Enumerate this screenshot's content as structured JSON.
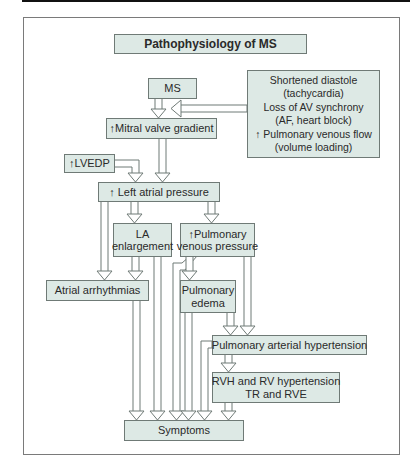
{
  "diagram": {
    "title": "Pathophysiology of MS",
    "nodes": {
      "ms": "MS",
      "precipitants": [
        "Shortened diastole",
        "(tachycardia)",
        "Loss of AV synchrony",
        "(AF, heart block)",
        "↑ Pulmonary venous flow",
        "(volume loading)"
      ],
      "mitral_gradient": "↑Mitral valve gradient",
      "lvedp": "↑LVEDP",
      "left_atrial_pressure": "↑ Left atrial pressure",
      "la_enlargement": [
        "LA",
        "enlargement"
      ],
      "pulm_venous_pressure": [
        "↑Pulmonary",
        "venous pressure"
      ],
      "atrial_arrhythmias": "Atrial arrhythmias",
      "pulmonary_edema": [
        "Pulmonary",
        "edema"
      ],
      "pah": "Pulmonary arterial hypertension",
      "rvh": [
        "RVH and RV hypertension",
        "TR and RVE"
      ],
      "symptoms": "Symptoms"
    },
    "edges": [
      {
        "from": "ms",
        "to": "mitral_gradient"
      },
      {
        "from": "precipitants",
        "to": "mitral_gradient"
      },
      {
        "from": "mitral_gradient",
        "to": "left_atrial_pressure"
      },
      {
        "from": "lvedp",
        "to": "left_atrial_pressure"
      },
      {
        "from": "left_atrial_pressure",
        "to": "la_enlargement"
      },
      {
        "from": "left_atrial_pressure",
        "to": "pulm_venous_pressure"
      },
      {
        "from": "left_atrial_pressure",
        "to": "atrial_arrhythmias"
      },
      {
        "from": "la_enlargement",
        "to": "atrial_arrhythmias"
      },
      {
        "from": "la_enlargement",
        "to": "symptoms"
      },
      {
        "from": "pulm_venous_pressure",
        "to": "pulmonary_edema"
      },
      {
        "from": "pulm_venous_pressure",
        "to": "symptoms"
      },
      {
        "from": "pulm_venous_pressure",
        "to": "pah"
      },
      {
        "from": "pulmonary_edema",
        "to": "symptoms"
      },
      {
        "from": "pulmonary_edema",
        "to": "pah"
      },
      {
        "from": "atrial_arrhythmias",
        "to": "symptoms"
      },
      {
        "from": "pah",
        "to": "rvh"
      },
      {
        "from": "pah",
        "to": "symptoms"
      },
      {
        "from": "rvh",
        "to": "symptoms"
      }
    ],
    "colors": {
      "box_fill": "#dde9e5",
      "box_border": "#6f7a76",
      "text": "#2a2a2a"
    }
  }
}
